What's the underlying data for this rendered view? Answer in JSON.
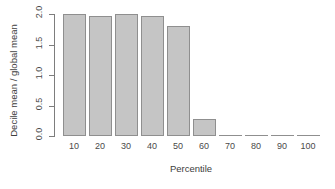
{
  "chart_data": {
    "type": "bar",
    "title": "",
    "xlabel": "Percentile",
    "ylabel": "Decile mean / global mean",
    "categories": [
      "10",
      "20",
      "30",
      "40",
      "50",
      "60",
      "70",
      "80",
      "90",
      "100"
    ],
    "values": [
      2.0,
      1.96,
      2.0,
      1.97,
      1.8,
      0.28,
      0.0,
      0.0,
      0.0,
      0.0
    ],
    "ylim": [
      0.0,
      2.0
    ],
    "yticks": [
      "0.0",
      "0.5",
      "1.0",
      "1.5",
      "2.0"
    ],
    "ytick_values": [
      0.0,
      0.5,
      1.0,
      1.5,
      2.0
    ],
    "xticks": [
      "10",
      "20",
      "30",
      "40",
      "50",
      "60",
      "70",
      "80",
      "90",
      "100"
    ],
    "grid": false,
    "legend": null,
    "bar_fill_color": "#c5c5c5",
    "bar_border_color": "#8f8f8f",
    "axis_color": "#7d7d7d",
    "background_color": "#ffffff"
  }
}
